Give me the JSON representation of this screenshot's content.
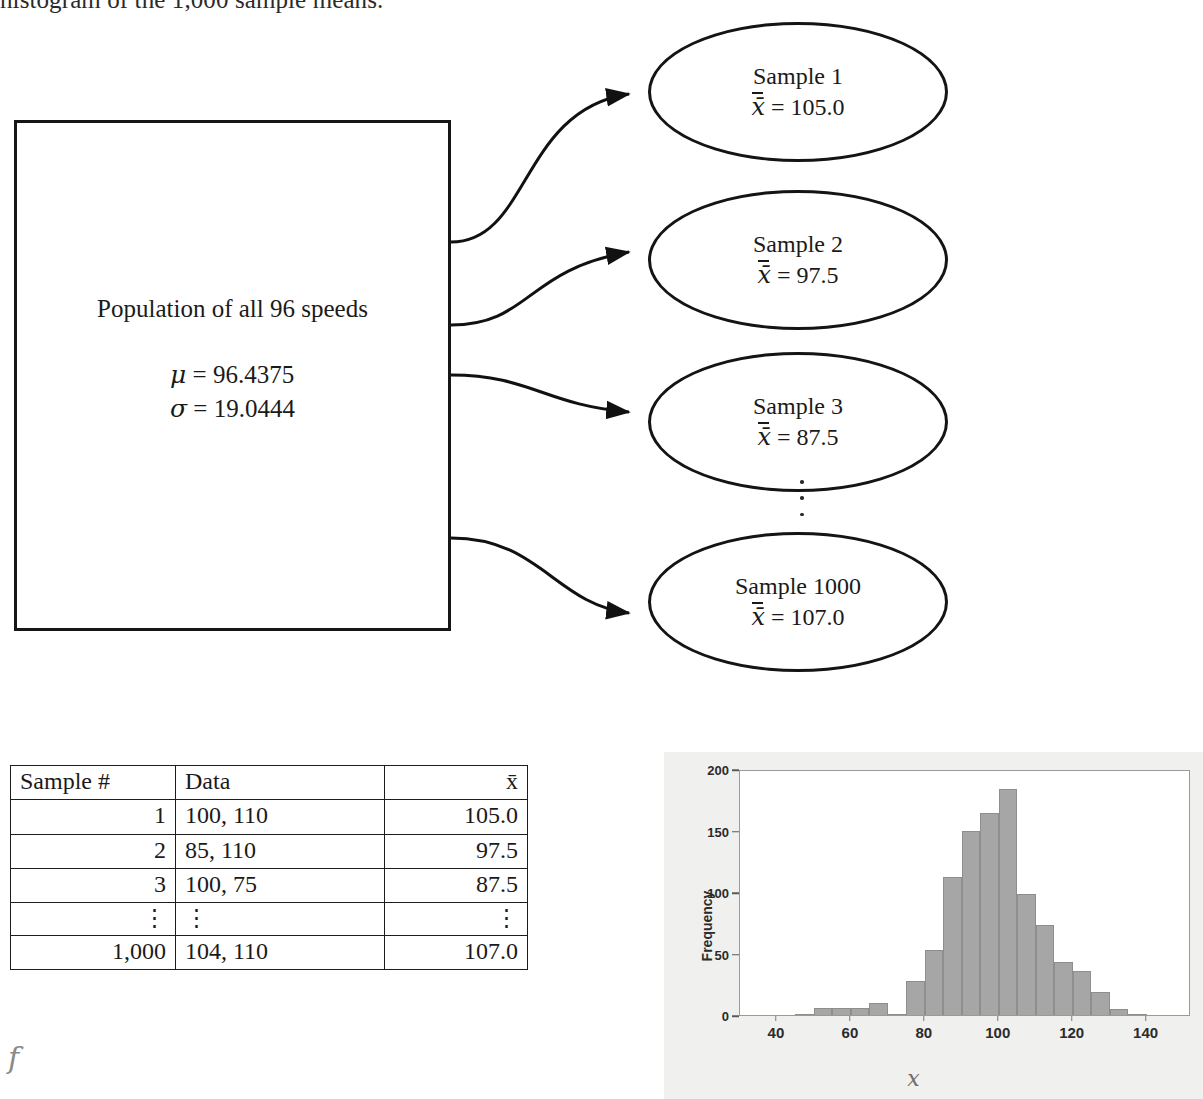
{
  "heading": {
    "clipped_text": "histogram of the 1,000 sample means."
  },
  "population": {
    "title": "Population of all 96 speeds",
    "mu_label": "μ",
    "mu_value": "= 96.4375",
    "mu_line": "μ = 96.4375",
    "sigma_label": "σ",
    "sigma_value": "= 19.0444",
    "sigma_line": "σ = 19.0444"
  },
  "samples": [
    {
      "name": "Sample 1",
      "mean_line": "= 105.0",
      "xbar": "x̄"
    },
    {
      "name": "Sample 2",
      "mean_line": "= 97.5",
      "xbar": "x̄"
    },
    {
      "name": "Sample 3",
      "mean_line": "= 87.5",
      "xbar": "x̄"
    },
    {
      "name": "Sample 1000",
      "mean_line": "= 107.0",
      "xbar": "x̄"
    }
  ],
  "ellipsis": "⋮",
  "table": {
    "headers": [
      "Sample #",
      "Data",
      "x̄"
    ],
    "rows": [
      {
        "num": "1",
        "data": "100, 110",
        "mean": "105.0"
      },
      {
        "num": "2",
        "data": "85, 110",
        "mean": "97.5"
      },
      {
        "num": "3",
        "data": "100, 75",
        "mean": "87.5"
      },
      {
        "num": "⋮",
        "data": "⋮",
        "mean": "⋮"
      },
      {
        "num": "1,000",
        "data": "104, 110",
        "mean": "107.0"
      }
    ]
  },
  "stray_glyph": "f",
  "chart_data": {
    "type": "bar",
    "title": "",
    "xlabel": "x̄",
    "ylabel": "Frequency",
    "xlim": [
      30,
      152
    ],
    "ylim": [
      0,
      200
    ],
    "grid": false,
    "legend": null,
    "bin_width": 5,
    "x_ticks": [
      "40",
      "60",
      "80",
      "100",
      "120",
      "140"
    ],
    "x_tick_values": [
      40,
      60,
      80,
      100,
      120,
      140
    ],
    "y_ticks": [
      "0",
      "50",
      "100",
      "150",
      "200"
    ],
    "y_tick_values": [
      0,
      50,
      100,
      150,
      200
    ],
    "bin_starts": [
      45,
      50,
      55,
      60,
      65,
      70,
      75,
      80,
      85,
      90,
      95,
      100,
      105,
      110,
      115,
      120,
      125,
      130,
      135
    ],
    "values": [
      1,
      6,
      6,
      6,
      10,
      1,
      28,
      53,
      112,
      150,
      164,
      184,
      98,
      73,
      43,
      36,
      19,
      5,
      1
    ],
    "bar_color": "#a6a6a6",
    "panel_color": "#f0f0ee",
    "plot_bg": "#ffffff"
  }
}
